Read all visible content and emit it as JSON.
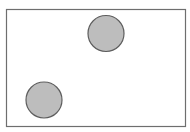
{
  "diagram": {
    "colors": {
      "frame_stroke": "#6e6e6e",
      "frame_fill": "#ffffff",
      "circle_fill": "#bdbdbd",
      "circle_stroke": "#5e5e5e"
    },
    "circles": [
      {
        "label": "upper-right circle"
      },
      {
        "label": "lower-left circle"
      }
    ]
  }
}
